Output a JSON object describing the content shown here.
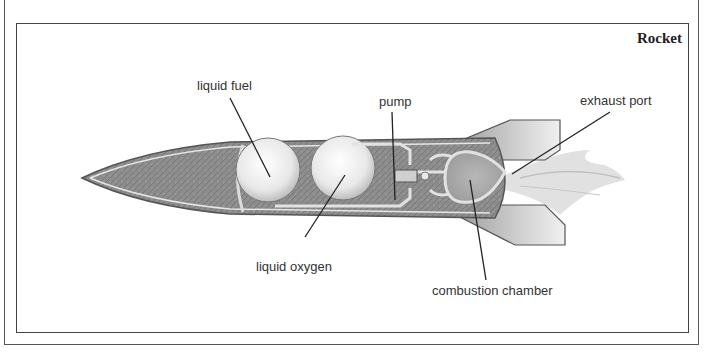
{
  "diagram": {
    "title": "Rocket",
    "labels": {
      "liquid_fuel": "liquid fuel",
      "pump": "pump",
      "exhaust_port": "exhaust port",
      "liquid_oxygen": "liquid oxygen",
      "combustion_chamber": "combustion chamber"
    },
    "colors": {
      "frame": "#444444",
      "body_fill": "#8a8a8a",
      "tank_fill": "#ececec",
      "leader_line": "#222222",
      "label_text": "#333333"
    }
  }
}
